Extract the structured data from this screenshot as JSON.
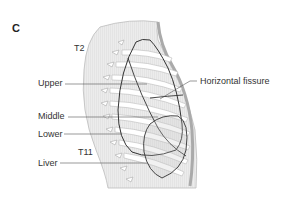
{
  "figure": {
    "panel_label": "C",
    "vertebra_labels": {
      "upper": "T2",
      "lower": "T11"
    },
    "labels": {
      "upper": "Upper",
      "middle": "Middle",
      "lower": "Lower",
      "liver": "Liver",
      "horizontal_fissure": "Horizontal fissure"
    },
    "colors": {
      "outline": "#333333",
      "body_fill": "#e6e6e6",
      "rib_fill": "#ffffff",
      "leader": "#555555"
    }
  }
}
